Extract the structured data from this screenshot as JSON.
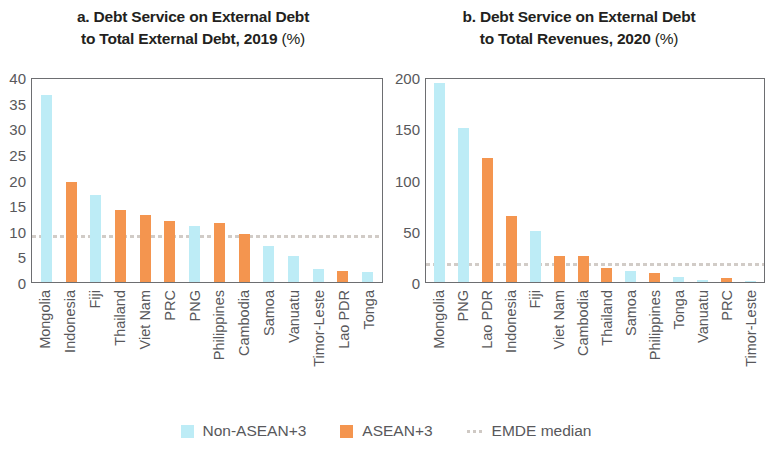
{
  "legend": {
    "items": [
      {
        "label": "Non-ASEAN+3",
        "type": "swatch",
        "color": "#bdecf6",
        "icon": "legend-swatch-non-asean"
      },
      {
        "label": "ASEAN+3",
        "type": "swatch",
        "color": "#f4954f",
        "icon": "legend-swatch-asean"
      },
      {
        "label": "EMDE median",
        "type": "line",
        "color": "#cfc9c4",
        "icon": "legend-line-emde-median"
      }
    ]
  },
  "panel_a": {
    "title_line1": "a. Debt Service on External Debt",
    "title_line2": "to Total External Debt, 2019 ",
    "title_unit": "(%)"
  },
  "panel_b": {
    "title_line1": "b. Debt Service on External Debt",
    "title_line2": "to Total Revenues, 2020 ",
    "title_unit": "(%)"
  },
  "chart_data": [
    {
      "type": "bar",
      "panel": "a",
      "title": "a. Debt Service on External Debt to Total External Debt, 2019 (%)",
      "xlabel": "",
      "ylabel": "",
      "ylim": [
        0,
        40
      ],
      "yticks": [
        40,
        35,
        30,
        25,
        20,
        15,
        10,
        5,
        0
      ],
      "grid": false,
      "legend_position": "bottom",
      "categories": [
        "Mongolia",
        "Indonesia",
        "Fiji",
        "Thailand",
        "Viet Nam",
        "PRC",
        "PNG",
        "Philippines",
        "Cambodia",
        "Samoa",
        "Vanuatu",
        "Timor-Leste",
        "Lao PDR",
        "Tonga"
      ],
      "values": [
        36.5,
        19.5,
        17.0,
        14.0,
        13.0,
        12.0,
        11.0,
        11.5,
        9.3,
        7.0,
        5.0,
        2.5,
        2.2,
        2.0
      ],
      "groups": [
        "Non-ASEAN+3",
        "ASEAN+3",
        "Non-ASEAN+3",
        "ASEAN+3",
        "ASEAN+3",
        "ASEAN+3",
        "Non-ASEAN+3",
        "ASEAN+3",
        "ASEAN+3",
        "Non-ASEAN+3",
        "Non-ASEAN+3",
        "Non-ASEAN+3",
        "ASEAN+3",
        "Non-ASEAN+3"
      ],
      "annotations": [
        {
          "name": "EMDE median",
          "type": "hline",
          "value": 8.5
        }
      ]
    },
    {
      "type": "bar",
      "panel": "b",
      "title": "b. Debt Service on External Debt to Total Revenues, 2020 (%)",
      "xlabel": "",
      "ylabel": "",
      "ylim": [
        0,
        200
      ],
      "yticks": [
        200,
        150,
        100,
        50,
        0
      ],
      "grid": false,
      "legend_position": "bottom",
      "categories": [
        "Mongolia",
        "PNG",
        "Lao PDR",
        "Indonesia",
        "Fiji",
        "Viet Nam",
        "Cambodia",
        "Thailand",
        "Samoa",
        "Philippines",
        "Tonga",
        "Vanuatu",
        "PRC",
        "Timor-Leste"
      ],
      "values": [
        194,
        150,
        121,
        64,
        50,
        25,
        25,
        14,
        11,
        9,
        5,
        2,
        4,
        0.5
      ],
      "groups": [
        "Non-ASEAN+3",
        "Non-ASEAN+3",
        "ASEAN+3",
        "ASEAN+3",
        "Non-ASEAN+3",
        "ASEAN+3",
        "ASEAN+3",
        "ASEAN+3",
        "Non-ASEAN+3",
        "ASEAN+3",
        "Non-ASEAN+3",
        "Non-ASEAN+3",
        "ASEAN+3",
        "Non-ASEAN+3"
      ],
      "annotations": [
        {
          "name": "EMDE median",
          "type": "hline",
          "value": 16
        }
      ]
    }
  ]
}
